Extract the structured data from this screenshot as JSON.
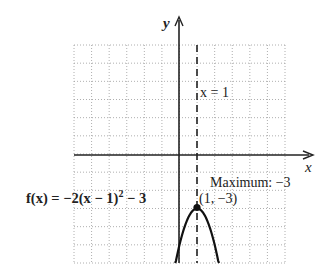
{
  "chart_data": {
    "type": "line",
    "title": "",
    "function_label": "f(x) = −2(x − 1)² − 3",
    "function": {
      "a": -2,
      "h": 1,
      "k": -3
    },
    "xlabel": "x",
    "ylabel": "y",
    "xlim": [
      -6,
      6
    ],
    "ylim": [
      -6,
      6
    ],
    "grid": true,
    "grid_style": "dotted",
    "tick_labels_shown": false,
    "series": [
      {
        "name": "f(x) = −2(x − 1)² − 3",
        "x": [
          -0.25,
          0,
          0.25,
          0.5,
          0.75,
          1,
          1.25,
          1.5,
          1.75,
          2,
          2.25
        ],
        "y": [
          -6.125,
          -5,
          -4.125,
          -3.5,
          -3.125,
          -3,
          -3.125,
          -3.5,
          -4.125,
          -5,
          -6.125
        ]
      }
    ],
    "annotations": [
      {
        "type": "vertical-dashed-line",
        "x": 1,
        "label": "x = 1"
      },
      {
        "type": "point",
        "x": 1,
        "y": -3,
        "label": "(1, −3)"
      },
      {
        "type": "text",
        "label": "Maximum: −3"
      }
    ]
  },
  "labels": {
    "axis_x": "x",
    "axis_y": "y",
    "axis_of_symmetry": "x = 1",
    "vertex": "(1, −3)",
    "maximum": "Maximum: −3",
    "func_prefix": "f(x) = −2(x − 1)",
    "func_exp": "2",
    "func_suffix": " − 3"
  }
}
